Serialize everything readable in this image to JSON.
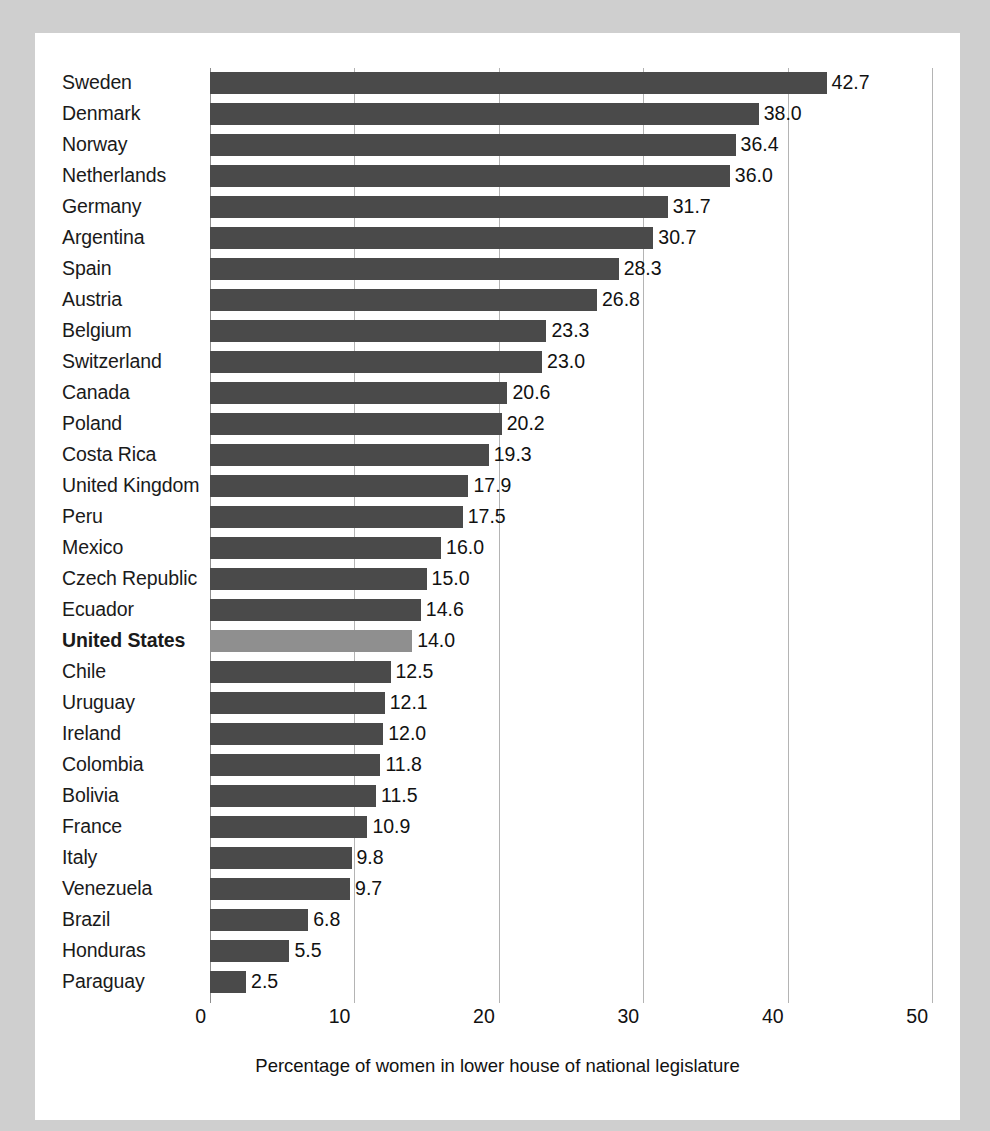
{
  "chart_data": {
    "type": "bar",
    "orientation": "horizontal",
    "title": "",
    "xlabel": "Percentage of women in lower house of national legislature",
    "ylabel": "",
    "xlim": [
      0,
      50
    ],
    "xticks": [
      0,
      10,
      20,
      30,
      40,
      50
    ],
    "xtick_labels": [
      "0",
      "10",
      "20",
      "30",
      "40",
      "50"
    ],
    "grid": true,
    "grid_axis": "x",
    "legend": false,
    "categories": [
      "Sweden",
      "Denmark",
      "Norway",
      "Netherlands",
      "Germany",
      "Argentina",
      "Spain",
      "Austria",
      "Belgium",
      "Switzerland",
      "Canada",
      "Poland",
      "Costa Rica",
      "United Kingdom",
      "Peru",
      "Mexico",
      "Czech Republic",
      "Ecuador",
      "United States",
      "Chile",
      "Uruguay",
      "Ireland",
      "Colombia",
      "Bolivia",
      "France",
      "Italy",
      "Venezuela",
      "Brazil",
      "Honduras",
      "Paraguay"
    ],
    "values": [
      42.7,
      38.0,
      36.4,
      36.0,
      31.7,
      30.7,
      28.3,
      26.8,
      23.3,
      23.0,
      20.6,
      20.2,
      19.3,
      17.9,
      17.5,
      16.0,
      15.0,
      14.6,
      14.0,
      12.5,
      12.1,
      12.0,
      11.8,
      11.5,
      10.9,
      9.8,
      9.7,
      6.8,
      5.5,
      2.5
    ],
    "value_labels": [
      "42.7",
      "38.0",
      "36.4",
      "36.0",
      "31.7",
      "30.7",
      "28.3",
      "26.8",
      "23.3",
      "23.0",
      "20.6",
      "20.2",
      "19.3",
      "17.9",
      "17.5",
      "16.0",
      "15.0",
      "14.6",
      "14.0",
      "12.5",
      "12.1",
      "12.0",
      "11.8",
      "11.5",
      "10.9",
      "9.8",
      "9.7",
      "6.8",
      "5.5",
      "2.5"
    ],
    "highlighted_category": "United States",
    "colors": {
      "bar": "#4a4a4a",
      "bar_highlight": "#8f8f8f",
      "gridline": "#b4b4b4",
      "axis": "#8e8e8e",
      "text": "#111111",
      "plot_background": "#ffffff",
      "page_background": "#cfcfcf"
    }
  }
}
